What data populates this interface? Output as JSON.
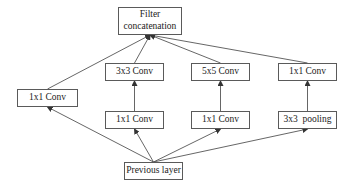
{
  "diagram": {
    "nodes": {
      "concat": {
        "label_line1": "Filter",
        "label_line2": "concatenation"
      },
      "conv1x1_a": {
        "label": "1x1 Conv"
      },
      "conv3x3": {
        "label": "3x3 Conv"
      },
      "conv1x1_b": {
        "label": "1x1 Conv"
      },
      "conv5x5": {
        "label": "5x5 Conv"
      },
      "conv1x1_c": {
        "label": "1x1 Conv"
      },
      "conv1x1_d": {
        "label": "1x1 Conv"
      },
      "pool3x3": {
        "label": "3x3  pooling"
      },
      "previous": {
        "label": "Previous layer"
      }
    },
    "edges": [
      {
        "from": "previous",
        "to": "conv1x1_a"
      },
      {
        "from": "previous",
        "to": "conv1x1_b"
      },
      {
        "from": "previous",
        "to": "conv1x1_c"
      },
      {
        "from": "previous",
        "to": "pool3x3"
      },
      {
        "from": "conv1x1_b",
        "to": "conv3x3"
      },
      {
        "from": "conv1x1_c",
        "to": "conv5x5"
      },
      {
        "from": "pool3x3",
        "to": "conv1x1_d"
      },
      {
        "from": "conv1x1_a",
        "to": "concat"
      },
      {
        "from": "conv3x3",
        "to": "concat"
      },
      {
        "from": "conv5x5",
        "to": "concat"
      },
      {
        "from": "conv1x1_d",
        "to": "concat"
      }
    ]
  }
}
